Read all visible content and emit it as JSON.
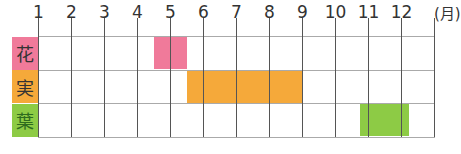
{
  "chart_data": {
    "type": "gantt",
    "title": "",
    "x_unit": "(月)",
    "categories": [
      "1",
      "2",
      "3",
      "4",
      "5",
      "6",
      "7",
      "8",
      "9",
      "10",
      "11",
      "12"
    ],
    "rows": [
      {
        "label": "花",
        "color": "#F07A9A",
        "label_color": "#333333",
        "start_month": 4.5,
        "end_month": 5.5
      },
      {
        "label": "実",
        "color": "#F5A93A",
        "label_color": "#333333",
        "start_month": 5.5,
        "end_month": 9.0
      },
      {
        "label": "葉",
        "color": "#8DCB45",
        "label_color": "#2E6B1E",
        "start_month": 10.75,
        "end_month": 12.25
      }
    ],
    "grid": true
  }
}
